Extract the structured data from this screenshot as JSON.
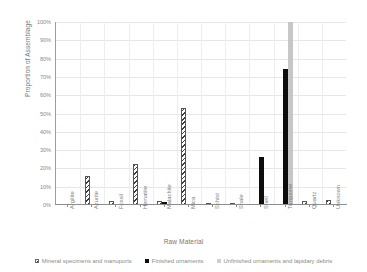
{
  "chart_data": {
    "type": "bar",
    "title": "",
    "xlabel": "Raw Material",
    "ylabel": "Proportion of Assemblage",
    "ylim": [
      0,
      100
    ],
    "ytick_labels": [
      "100%",
      "90%",
      "80%",
      "70%",
      "60%",
      "50%",
      "40%",
      "30%",
      "20%",
      "10%",
      "0%"
    ],
    "ytick_values": [
      100,
      90,
      80,
      70,
      60,
      50,
      40,
      30,
      20,
      10,
      0
    ],
    "grid": true,
    "legend_position": "bottom",
    "categories": [
      "Argilite",
      "Azurite",
      "Fossil",
      "Hematite",
      "Malachite",
      "Mica",
      "Schist",
      "Shale",
      "Shell",
      "Turquoise",
      "Quartz",
      "Unknown"
    ],
    "series": [
      {
        "name": "Mineral specimens and manuports",
        "style": "hatch",
        "color": "#3b3b3b",
        "values": [
          0,
          16,
          2,
          22.5,
          2,
          53,
          1,
          0.8,
          0,
          0,
          2,
          2.5
        ]
      },
      {
        "name": "Finished ornaments",
        "style": "solid",
        "color": "#0d0d0d",
        "values": [
          0,
          0,
          0,
          0,
          1.5,
          0,
          0,
          0,
          26,
          74.5,
          0,
          0
        ]
      },
      {
        "name": "Unfinished ornaments and lapidary debris",
        "style": "grey",
        "color": "#c7c7c7",
        "values": [
          0,
          0,
          0,
          0,
          0,
          0,
          0,
          0,
          0,
          100,
          0,
          0
        ]
      }
    ]
  }
}
